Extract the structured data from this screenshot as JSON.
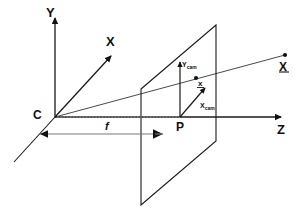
{
  "figure": {
    "type": "pinhole-camera-geometry-diagram",
    "background_color": "#ffffff",
    "line_color": "#1a1a1a",
    "dotted_color": "#999999"
  },
  "axes": {
    "y": {
      "label": "Y",
      "name": "y-axis"
    },
    "x": {
      "label": "X",
      "name": "x-axis"
    },
    "z": {
      "label": "Z",
      "name": "z-axis"
    }
  },
  "points": {
    "camera_center": {
      "label": "C",
      "name": "camera-center"
    },
    "principal_point": {
      "label": "P",
      "name": "principal-point"
    },
    "image_point": {
      "label": "x",
      "name": "image-point"
    },
    "world_point": {
      "label": "X",
      "name": "world-point"
    }
  },
  "vectors": {
    "y_cam": {
      "base": "Y",
      "sub": "cam",
      "label": "Ycam"
    },
    "x_cam": {
      "base": "X",
      "sub": "cam",
      "label": "Xcam"
    }
  },
  "measures": {
    "focal_length": {
      "label": "f",
      "name": "focal-length"
    }
  },
  "plane": {
    "name": "image-plane"
  }
}
